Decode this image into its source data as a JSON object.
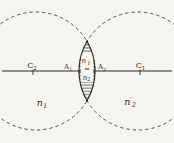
{
  "colors": {
    "paper": "#f5f4ef",
    "ink": "#2e2b26"
  },
  "labels": {
    "c2": {
      "base": "C",
      "sub": "2"
    },
    "a1": {
      "base": "A",
      "sub": "1"
    },
    "a2": {
      "base": "A",
      "sub": "2"
    },
    "c1": {
      "base": "C",
      "sub": "1"
    },
    "lens": {
      "top": {
        "base": "n",
        "prime": "′",
        "sub": "1"
      },
      "equals": "=",
      "bottom": {
        "base": "n",
        "sub": "2"
      }
    },
    "regions": {
      "left": {
        "base": "n",
        "sub": "1"
      },
      "right": {
        "base": "n",
        "prime": "′",
        "sub": "2"
      }
    }
  }
}
